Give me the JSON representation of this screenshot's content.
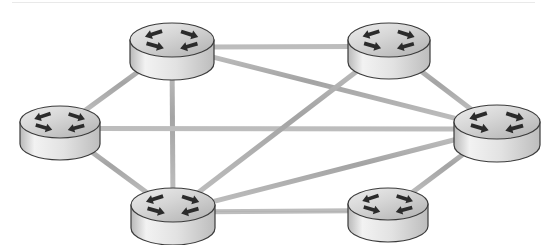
{
  "diagram": {
    "type": "network-topology",
    "canvas": {
      "width": 547,
      "height": 245,
      "background": "#ffffff"
    },
    "style": {
      "link_color": "#a9a9a9",
      "link_highlight": "#c6c6c6",
      "link_width": 5,
      "node_outline": "#3b3b3b",
      "node_top_fill": "#cfcfcf",
      "node_top_fill_light": "#e3e3e3",
      "node_body_fill": "#d8d8d8",
      "node_body_fill_light": "#f1f1f1",
      "node_shadow": "#9a9a9a",
      "arrow_color": "#2b2b2b"
    },
    "nodes": [
      {
        "id": "r1",
        "name": "router-top-left",
        "icon": "router-icon",
        "cx": 172,
        "cy": 40,
        "rx": 42,
        "ry": 17,
        "h": 23
      },
      {
        "id": "r2",
        "name": "router-top-right",
        "icon": "router-icon",
        "cx": 389,
        "cy": 40,
        "rx": 41,
        "ry": 17,
        "h": 22
      },
      {
        "id": "r3",
        "name": "router-left",
        "icon": "router-icon",
        "cx": 60,
        "cy": 122,
        "rx": 40,
        "ry": 16,
        "h": 22
      },
      {
        "id": "r4",
        "name": "router-right",
        "icon": "router-icon",
        "cx": 497,
        "cy": 122,
        "rx": 43,
        "ry": 17,
        "h": 23
      },
      {
        "id": "r5",
        "name": "router-bottom-left",
        "icon": "router-icon",
        "cx": 173,
        "cy": 205,
        "rx": 42,
        "ry": 17,
        "h": 23
      },
      {
        "id": "r6",
        "name": "router-bottom-right",
        "icon": "router-icon",
        "cx": 388,
        "cy": 204,
        "rx": 40,
        "ry": 16,
        "h": 22
      }
    ],
    "links": [
      {
        "id": "l1",
        "name": "link-top-left-to-top-right",
        "from": "r1",
        "to": "r2"
      },
      {
        "id": "l2",
        "name": "link-top-left-to-left",
        "from": "r1",
        "to": "r3"
      },
      {
        "id": "l3",
        "name": "link-top-left-to-bottom-left",
        "from": "r1",
        "to": "r5"
      },
      {
        "id": "l4",
        "name": "link-top-left-to-right",
        "from": "r1",
        "to": "r4"
      },
      {
        "id": "l5",
        "name": "link-left-to-right",
        "from": "r3",
        "to": "r4"
      },
      {
        "id": "l6",
        "name": "link-left-to-bottom-left",
        "from": "r3",
        "to": "r5"
      },
      {
        "id": "l7",
        "name": "link-top-right-to-right",
        "from": "r2",
        "to": "r4"
      },
      {
        "id": "l8",
        "name": "link-top-right-to-bottom-left",
        "from": "r2",
        "to": "r5"
      },
      {
        "id": "l9",
        "name": "link-bottom-left-to-right",
        "from": "r5",
        "to": "r4"
      },
      {
        "id": "l10",
        "name": "link-bottom-left-to-bottom-right",
        "from": "r5",
        "to": "r6"
      },
      {
        "id": "l11",
        "name": "link-bottom-right-to-right",
        "from": "r6",
        "to": "r4"
      }
    ],
    "artifacts": [
      {
        "name": "scan-artifact-line",
        "x": 12,
        "y": 2,
        "width": 523
      }
    ]
  }
}
